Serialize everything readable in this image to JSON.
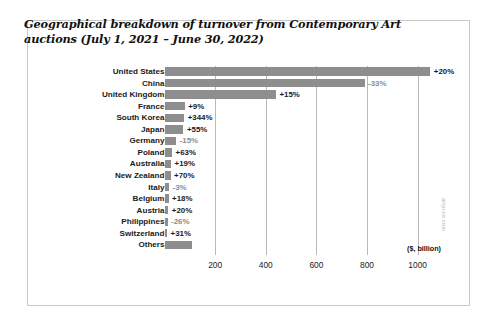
{
  "chart_data": {
    "type": "bar",
    "orientation": "horizontal",
    "title": "Geographical breakdown of turnover from Contemporary Art auctions (July 1, 2021 – June 30, 2022)",
    "xlabel": "($, billion)",
    "ylabel": "",
    "xlim": [
      0,
      1100
    ],
    "xticks": [
      200,
      400,
      600,
      800,
      1000
    ],
    "xticklabels": [
      "200",
      "400",
      "600",
      "800",
      "1000"
    ],
    "grid": true,
    "legend": null,
    "categories": [
      "United States",
      "China",
      "United Kingdom",
      "France",
      "South Korea",
      "Japan",
      "Germany",
      "Poland",
      "Australia",
      "New Zealand",
      "Italy",
      "Belgium",
      "Austria",
      "Philippines",
      "Switzerland",
      "Others"
    ],
    "values": [
      1050,
      790,
      440,
      80,
      78,
      75,
      46,
      30,
      26,
      24,
      18,
      16,
      15,
      12,
      10,
      110
    ],
    "annotations": [
      "+20%",
      "-33%",
      "+15%",
      "+9%",
      "+344%",
      "+55%",
      "-15%",
      "+63%",
      "+19%",
      "+70%",
      "-3%",
      "+18%",
      "+20%",
      "-26%",
      "+31%",
      ""
    ],
    "annotation_sign": [
      "pos",
      "neg",
      "pos",
      "pos",
      "pos",
      "pos",
      "neg",
      "pos",
      "pos",
      "pos",
      "neg",
      "pos",
      "pos",
      "neg",
      "pos",
      "none"
    ]
  },
  "watermark": "artprice.com",
  "colors": {
    "bar": "#8e8e8e",
    "grid": "#b9b9b9",
    "frame": "#c8c8c8",
    "text": "#1a1a1a",
    "negative_label": "#8c8c8c"
  }
}
